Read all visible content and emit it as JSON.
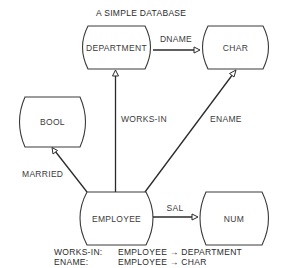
{
  "title": "A SIMPLE DATABASE",
  "nodes": {
    "department": {
      "label": "DEPARTMENT"
    },
    "char": {
      "label": "CHAR"
    },
    "bool": {
      "label": "BOOL"
    },
    "employee": {
      "label": "EMPLOYEE"
    },
    "num": {
      "label": "NUM"
    }
  },
  "edges": {
    "dname": {
      "label": "DNAME",
      "from": "DEPARTMENT",
      "to": "CHAR"
    },
    "works_in": {
      "label": "WORKS-IN",
      "from": "EMPLOYEE",
      "to": "DEPARTMENT"
    },
    "ename": {
      "label": "ENAME",
      "from": "EMPLOYEE",
      "to": "CHAR"
    },
    "married": {
      "label": "MARRIED",
      "from": "EMPLOYEE",
      "to": "BOOL"
    },
    "sal": {
      "label": "SAL",
      "from": "EMPLOYEE",
      "to": "NUM"
    }
  },
  "legend": [
    {
      "name": "WORKS-IN:",
      "mapping": "EMPLOYEE → DEPARTMENT"
    },
    {
      "name": "ENAME:",
      "mapping": "EMPLOYEE → CHAR"
    }
  ]
}
